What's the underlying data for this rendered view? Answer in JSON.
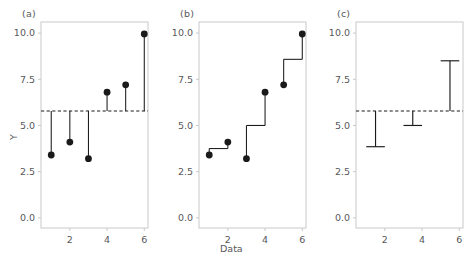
{
  "figure": {
    "width": 472,
    "height": 267,
    "background": "#ffffff",
    "axis_color": "#c9c9c9",
    "tick_label_color": "#58585a",
    "data_color": "#1a1a1a",
    "reference_line_color": "#1a1a1a"
  },
  "axes": {
    "y_ticks": [
      "0.0",
      "2.5",
      "5.0",
      "7.5",
      "10.0"
    ],
    "y_tick_values": [
      0.0,
      2.5,
      5.0,
      7.5,
      10.0
    ],
    "x_ticks": [
      "2",
      "4",
      "6"
    ],
    "x_tick_values": [
      2,
      4,
      6
    ],
    "ylim": [
      -0.55,
      10.6
    ],
    "xlim": [
      0.45,
      6.2
    ],
    "ylabel": "Y",
    "xlabel": "Data"
  },
  "panels": [
    {
      "key": "a",
      "label": "(a)"
    },
    {
      "key": "b",
      "label": "(b)"
    },
    {
      "key": "c",
      "label": "(c)"
    }
  ],
  "chart_data": [
    {
      "type": "scatter",
      "panel": "(a)",
      "title": "",
      "xlabel": "",
      "ylabel": "Y",
      "x": [
        1,
        2,
        3,
        4,
        5,
        6
      ],
      "values": [
        3.4,
        4.1,
        3.2,
        6.8,
        7.2,
        9.95
      ],
      "xticks": [
        2,
        4,
        6
      ],
      "yticks": [
        0.0,
        2.5,
        5.0,
        7.5,
        10.0
      ],
      "xlim": [
        0.45,
        6.2
      ],
      "ylim": [
        -0.55,
        10.6
      ],
      "grid": false,
      "legend": "none",
      "annotations": [
        {
          "kind": "hline",
          "label": "grand mean",
          "y": 5.78,
          "style": "dashed"
        }
      ],
      "stems": {
        "from": 5.78,
        "description": "vertical stem from grand mean to each point"
      }
    },
    {
      "type": "scatter",
      "panel": "(b)",
      "title": "",
      "xlabel": "Data",
      "ylabel": "",
      "x": [
        1,
        2,
        3,
        4,
        5,
        6
      ],
      "values": [
        3.4,
        4.1,
        3.2,
        6.8,
        7.2,
        9.95
      ],
      "xticks": [
        2,
        4,
        6
      ],
      "yticks": [
        0.0,
        2.5,
        5.0,
        7.5,
        10.0
      ],
      "xlim": [
        0.45,
        6.2
      ],
      "ylim": [
        -0.55,
        10.6
      ],
      "grid": false,
      "legend": "none",
      "pairs": [
        {
          "points": [
            1,
            2
          ],
          "mean": 3.75
        },
        {
          "points": [
            3,
            4
          ],
          "mean": 5.0
        },
        {
          "points": [
            5,
            6
          ],
          "mean": 8.58
        }
      ],
      "annotations": [
        {
          "kind": "step-connector",
          "label": "pair mean connectors"
        }
      ]
    },
    {
      "type": "bar",
      "panel": "(c)",
      "title": "",
      "xlabel": "",
      "ylabel": "",
      "categories": [
        "pair 1-2",
        "pair 3-4",
        "pair 5-6"
      ],
      "x": [
        1.5,
        3.5,
        5.5
      ],
      "values": [
        3.85,
        5.0,
        8.5
      ],
      "baseline": 5.78,
      "xticks": [
        2,
        4,
        6
      ],
      "yticks": [
        0.0,
        2.5,
        5.0,
        7.5,
        10.0
      ],
      "xlim": [
        0.45,
        6.2
      ],
      "ylim": [
        -0.55,
        10.6
      ],
      "grid": false,
      "legend": "none",
      "annotations": [
        {
          "kind": "hline",
          "label": "grand mean",
          "y": 5.78,
          "style": "dashed"
        }
      ]
    }
  ]
}
